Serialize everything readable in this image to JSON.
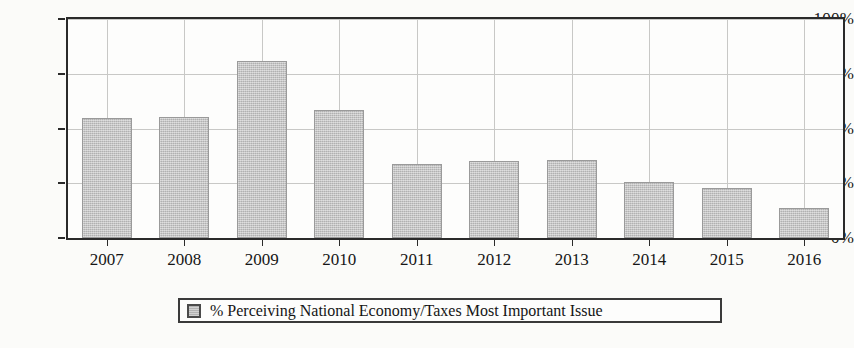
{
  "chart_data": {
    "type": "bar",
    "title": "",
    "subtitle": "",
    "xlabel": "",
    "ylabel": "",
    "categories": [
      "2007",
      "2008",
      "2009",
      "2010",
      "2011",
      "2012",
      "2013",
      "2014",
      "2015",
      "2016"
    ],
    "values": [
      55,
      55.5,
      81,
      58.5,
      34,
      35,
      35.5,
      25.5,
      23,
      13.5
    ],
    "series": [
      {
        "name": "% Perceiving National Economy/Taxes Most Important Issue",
        "values": [
          55,
          55.5,
          81,
          58.5,
          34,
          35,
          35.5,
          25.5,
          23,
          13.5
        ]
      }
    ],
    "ylim": [
      0,
      100
    ],
    "ytick_values": [
      0,
      25,
      50,
      75,
      100
    ],
    "ytick_labels": [
      "0%",
      "25%",
      "50%",
      "75%",
      "100%"
    ],
    "grid": true,
    "grid_axis": "both",
    "legend_position": "bottom-center",
    "legend_entries": [
      {
        "label": "% Perceiving National Economy/Taxes Most Important Issue",
        "swatch_color": "#bdbdbd"
      }
    ],
    "bar_color": "#c3c3c3",
    "bar_edge_color": "#9a9a9a",
    "axis_color": "#2a2a2a",
    "grid_color": "#c8c8c6",
    "background_color": "#fbfbf9"
  }
}
